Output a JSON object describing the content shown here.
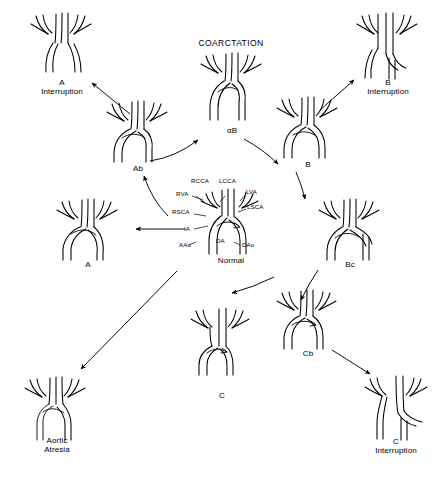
{
  "diagram": {
    "title": "COARCTATION",
    "title_pos": {
      "x": 196,
      "y": 41
    },
    "background": "#ffffff",
    "stroke_color": "#000000",
    "width": 439,
    "height": 479,
    "nodes": [
      {
        "id": "a-interruption",
        "caption": "A\nInterruption",
        "variant": "interrupt-a",
        "x": 22,
        "y": 12,
        "w": 76,
        "h": 70,
        "cap_x": 22,
        "cap_y": 78,
        "cap_w": 76
      },
      {
        "id": "coarctation-ab",
        "caption": "αB",
        "variant": "coarct-ab",
        "x": 196,
        "y": 52,
        "w": 70,
        "h": 72,
        "cap_x": 196,
        "cap_y": 126,
        "cap_w": 70
      },
      {
        "id": "b-interruption",
        "caption": "B\nInterruption",
        "variant": "interrupt-b",
        "x": 348,
        "y": 12,
        "w": 76,
        "h": 70,
        "cap_x": 346,
        "cap_y": 78,
        "cap_w": 80
      },
      {
        "id": "ab",
        "caption": "Ab",
        "variant": "ab",
        "x": 100,
        "y": 98,
        "w": 72,
        "h": 62,
        "cap_x": 100,
        "cap_y": 162,
        "cap_w": 72
      },
      {
        "id": "b",
        "caption": "B",
        "variant": "b",
        "x": 272,
        "y": 95,
        "w": 72,
        "h": 62,
        "cap_x": 272,
        "cap_y": 160,
        "cap_w": 72
      },
      {
        "id": "a",
        "caption": "A",
        "variant": "a",
        "x": 52,
        "y": 196,
        "w": 72,
        "h": 62,
        "cap_x": 52,
        "cap_y": 259,
        "cap_w": 72
      },
      {
        "id": "normal",
        "caption": "Normal",
        "variant": "normal",
        "x": 198,
        "y": 186,
        "w": 64,
        "h": 68,
        "cap_x": 190,
        "cap_y": 256,
        "cap_w": 80
      },
      {
        "id": "bc",
        "caption": "Bc",
        "variant": "bc",
        "x": 314,
        "y": 196,
        "w": 72,
        "h": 62,
        "cap_x": 314,
        "cap_y": 258,
        "cap_w": 72
      },
      {
        "id": "c",
        "caption": "C",
        "variant": "c",
        "x": 186,
        "y": 305,
        "w": 72,
        "h": 62,
        "cap_x": 186,
        "cap_y": 392,
        "cap_w": 72
      },
      {
        "id": "cb",
        "caption": "Cb",
        "variant": "cb",
        "x": 272,
        "y": 289,
        "w": 72,
        "h": 62,
        "cap_x": 272,
        "cap_y": 349,
        "cap_w": 72
      },
      {
        "id": "c-interruption",
        "caption": "C\nInterruption",
        "variant": "interrupt-c",
        "x": 356,
        "y": 373,
        "w": 76,
        "h": 68,
        "cap_x": 352,
        "cap_y": 438,
        "cap_w": 84
      },
      {
        "id": "aortic-atresia",
        "caption": "Aortic\nAtresia",
        "variant": "atresia",
        "x": 18,
        "y": 374,
        "w": 72,
        "h": 68,
        "cap_x": 14,
        "cap_y": 438,
        "cap_w": 80
      }
    ],
    "vessel_labels": [
      {
        "id": "rcca",
        "text": "RCCA",
        "x": 192,
        "y": 178
      },
      {
        "id": "lcca",
        "text": "LCCA",
        "x": 220,
        "y": 178
      },
      {
        "id": "rva",
        "text": "RVA",
        "x": 178,
        "y": 193
      },
      {
        "id": "lva",
        "text": "LVA",
        "x": 247,
        "y": 190
      },
      {
        "id": "rsca",
        "text": "RSCA",
        "x": 174,
        "y": 211
      },
      {
        "id": "lsca",
        "text": "LSCA",
        "x": 248,
        "y": 205
      },
      {
        "id": "ia",
        "text": "IA",
        "x": 185,
        "y": 228
      },
      {
        "id": "aao",
        "text": "AAo",
        "x": 181,
        "y": 244
      },
      {
        "id": "da",
        "text": "DA",
        "x": 217,
        "y": 240
      },
      {
        "id": "dao",
        "text": "DAo",
        "x": 243,
        "y": 244
      }
    ],
    "connections": [
      {
        "id": "ab-to-a-interruption",
        "from": "ab",
        "to": "a-interruption",
        "shape": "straight",
        "x1": 130,
        "y1": 114,
        "x2": 92,
        "y2": 83
      },
      {
        "id": "ab-to-coarctation",
        "from": "ab",
        "to": "coarctation-ab",
        "shape": "curve",
        "x1": 152,
        "y1": 160,
        "cx": 178,
        "cy": 156,
        "x2": 196,
        "y2": 140
      },
      {
        "id": "coarctation-to-b",
        "from": "coarctation-ab",
        "to": "b",
        "shape": "curve",
        "x1": 244,
        "y1": 140,
        "cx": 262,
        "cy": 152,
        "x2": 276,
        "y2": 162
      },
      {
        "id": "b-to-b-interruption",
        "from": "b",
        "to": "b-interruption",
        "shape": "straight",
        "x1": 318,
        "y1": 110,
        "x2": 352,
        "y2": 80
      },
      {
        "id": "normal-to-ab",
        "from": "normal",
        "to": "ab",
        "shape": "curve",
        "x1": 168,
        "y1": 214,
        "cx": 152,
        "cy": 198,
        "x2": 144,
        "y2": 176
      },
      {
        "id": "normal-to-a",
        "from": "normal",
        "to": "a",
        "shape": "straight",
        "x1": 184,
        "y1": 228,
        "x2": 134,
        "y2": 228
      },
      {
        "id": "normal-to-bc",
        "from": "normal",
        "to": "bc",
        "shape": "curve",
        "x1": 272,
        "y1": 214,
        "cx": 296,
        "cy": 200,
        "x2": 312,
        "y2": 196
      },
      {
        "id": "b-to-bc",
        "from": "b",
        "to": "bc",
        "shape": "curve",
        "x1": 294,
        "y1": 170,
        "cx": 300,
        "cy": 186,
        "x2": 304,
        "y2": 200
      },
      {
        "id": "bc-to-cb",
        "from": "bc",
        "to": "cb",
        "shape": "curve",
        "x1": 316,
        "y1": 268,
        "cx": 306,
        "cy": 284,
        "x2": 300,
        "y2": 298
      },
      {
        "id": "normal-to-c",
        "from": "normal",
        "to": "c",
        "shape": "curve",
        "x1": 272,
        "y1": 276,
        "cx": 254,
        "cy": 286,
        "x2": 232,
        "y2": 293
      },
      {
        "id": "normal-to-atresia",
        "from": "normal",
        "to": "aortic-atresia",
        "shape": "straight",
        "x1": 176,
        "y1": 272,
        "x2": 80,
        "y2": 370
      },
      {
        "id": "cb-to-c-interruption",
        "from": "cb",
        "to": "c-interruption",
        "shape": "straight",
        "x1": 334,
        "y1": 351,
        "x2": 370,
        "y2": 374
      }
    ]
  }
}
